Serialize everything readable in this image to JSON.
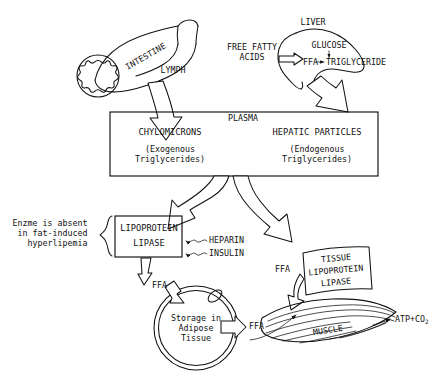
{
  "diagram": {
    "type": "biomedical-flow-diagram",
    "ink_color": "#111111",
    "background_color": "#ffffff"
  },
  "organs": {
    "intestine": {
      "label": "INTESTINE",
      "shape": "intestine-tube-with-villi-cross-section"
    },
    "liver": {
      "label": "LIVER",
      "shape": "liver-lobe-outline"
    },
    "muscle": {
      "label": "MUSCLE",
      "shape": "striated-muscle-fibers"
    },
    "adipose": {
      "label": "Storage in\nAdipose\nTissue",
      "shape": "adipocyte-circle-with-nucleus"
    }
  },
  "liver_reactions": {
    "free_fatty_acids_label": "FREE FATTY\nACIDS",
    "ffa": "FFA",
    "glucose": "GLUCOSE",
    "triglyceride": "TRIGLYCERIDE"
  },
  "plasma_box": {
    "title": "PLASMA",
    "left_particle": {
      "name": "CHYLOMICRONS",
      "subtitle": "(Exogenous\nTriglycerides)"
    },
    "right_particle": {
      "name": "HEPATIC PARTICLES",
      "subtitle": "(Endogenous\nTriglycerides)"
    }
  },
  "lymph_label": "LYMPH",
  "lipoprotein_lipase_box": {
    "line1": "LIPOPROTEIN",
    "line2": "LIPASE"
  },
  "annotation_left": {
    "text": "Enzme is absent\nin fat-induced\nhyperlipemia",
    "brace": "curly-brace-right"
  },
  "modulators": [
    {
      "label": "HEPARIN",
      "arrow": "wavy-arrow-left"
    },
    {
      "label": "INSULIN",
      "arrow": "wavy-arrow-left"
    }
  ],
  "tissue_lipase_box": {
    "line1": "TISSUE",
    "line2": "LIPOPROTEIN",
    "line3": "LIPASE"
  },
  "ffa_labels": {
    "from_lipase": "FFA",
    "from_adipose": "FFA",
    "to_muscle": "FFA"
  },
  "muscle_output": {
    "text": "ATP",
    "plus": "+",
    "species": "CO",
    "subscript": "2",
    "full": "ATP+CO2"
  }
}
